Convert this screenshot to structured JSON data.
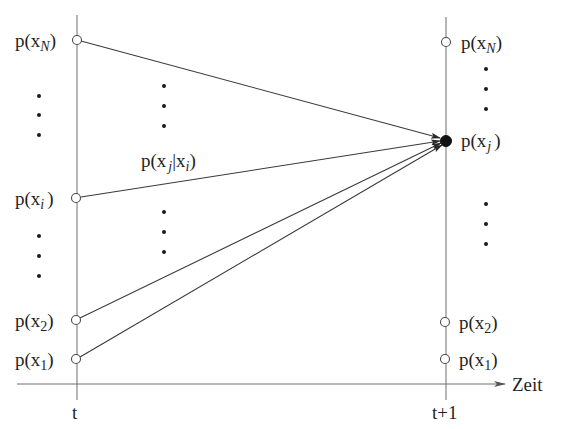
{
  "diagram": {
    "type": "state-transition",
    "axis": {
      "label": "Zeit",
      "ticks": [
        {
          "label": "t"
        },
        {
          "label": "t+1"
        }
      ]
    },
    "left_column": {
      "nodes": [
        {
          "id": "xN",
          "base": "p(x",
          "sub": "N",
          "close": ")"
        },
        {
          "id": "xi",
          "base": "p(x",
          "sub": "i",
          "close": ")"
        },
        {
          "id": "x2",
          "base": "p(x",
          "sub": "2",
          "close": ")"
        },
        {
          "id": "x1",
          "base": "p(x",
          "sub": "1",
          "close": ")"
        }
      ],
      "ellipses": [
        "⋮",
        "⋮"
      ]
    },
    "right_column": {
      "nodes": [
        {
          "id": "xN",
          "base": "p(x",
          "sub": "N",
          "close": ")"
        },
        {
          "id": "xj",
          "base": "p(x",
          "sub": "j",
          "close": ")",
          "highlighted": true
        },
        {
          "id": "x2",
          "base": "p(x",
          "sub": "2",
          "close": ")"
        },
        {
          "id": "x1",
          "base": "p(x",
          "sub": "1",
          "close": ")"
        }
      ],
      "ellipses": [
        "⋮",
        "⋮"
      ]
    },
    "transition_label": {
      "base": "p(x",
      "sub1": "j",
      "sep": "|x",
      "sub2": "i",
      "close": ")"
    },
    "edges": [
      {
        "from": "t:xN",
        "to": "t+1:xj"
      },
      {
        "from": "t:xi",
        "to": "t+1:xj"
      },
      {
        "from": "t:x2",
        "to": "t+1:xj"
      },
      {
        "from": "t:x1",
        "to": "t+1:xj"
      }
    ]
  }
}
